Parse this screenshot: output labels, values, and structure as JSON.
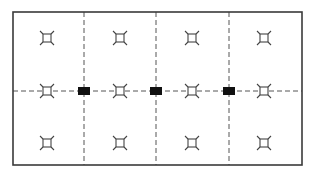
{
  "diagram": {
    "type": "lighting-plan",
    "frame": {
      "x": 13,
      "y": 12,
      "width": 289,
      "height": 153,
      "stroke": "#3a3a3a"
    },
    "dividers": {
      "vertical_x": [
        84,
        156,
        229
      ],
      "horizontal_y": 91,
      "style": "dashed",
      "stroke": "#555555"
    },
    "fixture_symbol": "square-with-corner-ticks",
    "fixtures": [
      {
        "col": 0,
        "row": 0,
        "x": 47,
        "y": 38
      },
      {
        "col": 1,
        "row": 0,
        "x": 120,
        "y": 38
      },
      {
        "col": 2,
        "row": 0,
        "x": 192,
        "y": 38
      },
      {
        "col": 3,
        "row": 0,
        "x": 264,
        "y": 38
      },
      {
        "col": 0,
        "row": 1,
        "x": 47,
        "y": 91
      },
      {
        "col": 1,
        "row": 1,
        "x": 120,
        "y": 91
      },
      {
        "col": 2,
        "row": 1,
        "x": 192,
        "y": 91
      },
      {
        "col": 3,
        "row": 1,
        "x": 264,
        "y": 91
      },
      {
        "col": 0,
        "row": 2,
        "x": 47,
        "y": 143
      },
      {
        "col": 1,
        "row": 2,
        "x": 120,
        "y": 143
      },
      {
        "col": 2,
        "row": 2,
        "x": 192,
        "y": 143
      },
      {
        "col": 3,
        "row": 2,
        "x": 264,
        "y": 143
      }
    ],
    "junction_boxes": [
      {
        "x": 84,
        "y": 91,
        "width": 12,
        "height": 8,
        "fill": "#111111"
      },
      {
        "x": 156,
        "y": 91,
        "width": 12,
        "height": 8,
        "fill": "#111111"
      },
      {
        "x": 229,
        "y": 91,
        "width": 12,
        "height": 8,
        "fill": "#111111"
      }
    ]
  }
}
